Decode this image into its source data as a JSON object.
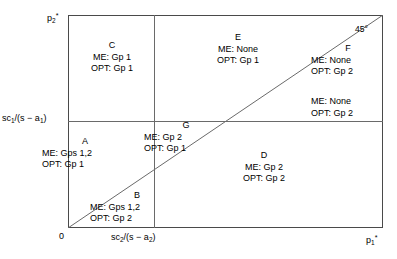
{
  "figure": {
    "axes": {
      "y_top_label": "p",
      "y_top_sub": "2",
      "y_top_sup": "*",
      "y_mid_label": "sc",
      "y_mid_sub": "1",
      "y_mid_rest": "/(s − a",
      "y_mid_sub2": "1",
      "y_mid_tail": ")",
      "x_origin_label": "0",
      "x_mid_label": "sc",
      "x_mid_sub": "2",
      "x_mid_rest": "/(s − a",
      "x_mid_sub2": "2",
      "x_mid_tail": ")",
      "x_right_label": "p",
      "x_right_sub": "1",
      "x_right_sup": "*",
      "diagonal_angle_label": "45°"
    },
    "regions": [
      {
        "id": "C",
        "tag": "C",
        "me": "ME: Gp 1",
        "opt": "OPT: Gp 1"
      },
      {
        "id": "E",
        "tag": "E",
        "me": "ME: None",
        "opt": "OPT: Gp 1"
      },
      {
        "id": "F",
        "tag": "F",
        "me": "ME: None",
        "opt": "OPT: Gp 2"
      },
      {
        "id": "F2",
        "tag": "",
        "me": "ME: None",
        "opt": "OPT: Gp 2"
      },
      {
        "id": "A",
        "tag": "A",
        "me": "ME: Gps 1,2",
        "opt": "OPT: Gp 1"
      },
      {
        "id": "G",
        "tag": "G",
        "me": "ME: Gp 2",
        "opt": "OPT: Gp 1"
      },
      {
        "id": "B",
        "tag": "B",
        "me": "ME: Gps 1,2",
        "opt": "OPT: Gp 2"
      },
      {
        "id": "D",
        "tag": "D",
        "me": "ME: Gp 2",
        "opt": "OPT: Gp 2"
      }
    ],
    "colors": {
      "frame": "#4a4a4a",
      "partition_line": "#6a6a6a",
      "diagonal_line": "#6a6a6a",
      "text": "#000000",
      "background": "#ffffff"
    }
  }
}
